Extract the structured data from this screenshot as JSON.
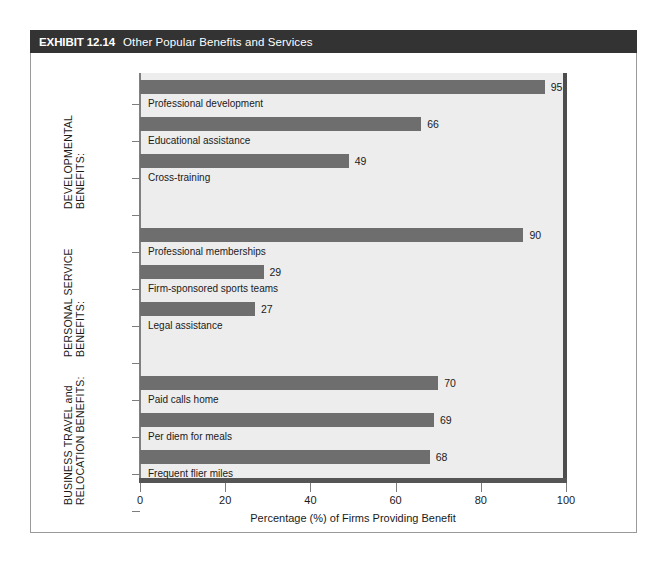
{
  "exhibit": {
    "number_label": "EXHIBIT 12.14",
    "title": "Other Popular Benefits and Services"
  },
  "colors": {
    "title_bar_bg": "#333333",
    "title_bar_text": "#ffffff",
    "plot_bg": "#ededed",
    "bar_fill": "#6e6e6e",
    "axis_line": "#555555",
    "frame_border": "#9a9a9a"
  },
  "chart_data": {
    "type": "bar",
    "orientation": "horizontal",
    "title": "Other Popular Benefits and Services",
    "xlabel": "Percentage (%) of Firms Providing Benefit",
    "ylabel": "",
    "xlim": [
      0,
      100
    ],
    "xticks": [
      0,
      20,
      40,
      60,
      80,
      100
    ],
    "xtick_labels": [
      "0",
      "20",
      "40",
      "60",
      "80",
      "100"
    ],
    "grid": false,
    "legend": "none",
    "categories": [
      "Professional development",
      "Educational assistance",
      "Cross-training",
      "Professional memberships",
      "Firm-sponsored sports teams",
      "Legal assistance",
      "Paid calls home",
      "Per diem for meals",
      "Frequent flier miles"
    ],
    "values": [
      95,
      66,
      49,
      90,
      29,
      27,
      70,
      69,
      68
    ],
    "groups": [
      {
        "label_line1": "DEVELOPMENTAL",
        "label_line2": "BENEFITS:",
        "items": [
          {
            "label": "Professional development",
            "value": 95
          },
          {
            "label": "Educational assistance",
            "value": 66
          },
          {
            "label": "Cross-training",
            "value": 49
          }
        ]
      },
      {
        "label_line1": "PERSONAL SERVICE",
        "label_line2": "BENEFITS:",
        "items": [
          {
            "label": "Professional memberships",
            "value": 90
          },
          {
            "label": "Firm-sponsored sports teams",
            "value": 29
          },
          {
            "label": "Legal assistance",
            "value": 27
          }
        ]
      },
      {
        "label_line1": "BUSINESS TRAVEL and",
        "label_line2": "RELOCATION BENEFITS:",
        "items": [
          {
            "label": "Paid calls home",
            "value": 70
          },
          {
            "label": "Per diem for meals",
            "value": 69
          },
          {
            "label": "Frequent flier miles",
            "value": 68
          }
        ]
      }
    ]
  }
}
